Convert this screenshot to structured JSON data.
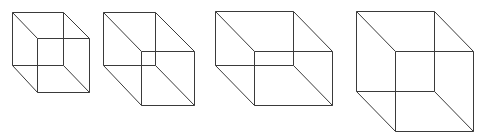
{
  "diagram": {
    "title": "",
    "stroke_color": "#3a3a3a",
    "background": "#ffffff",
    "cubes": [
      {
        "name": "cube-1",
        "back": {
          "tl": [
            12,
            12
          ],
          "tr": [
            63,
            12
          ],
          "bl": [
            12,
            65
          ],
          "br": [
            63,
            65
          ]
        },
        "front": {
          "tl": [
            37,
            38
          ],
          "tr": [
            89,
            38
          ],
          "bl": [
            37,
            92
          ],
          "br": [
            89,
            92
          ]
        }
      },
      {
        "name": "cube-2",
        "back": {
          "tl": [
            103,
            12
          ],
          "tr": [
            155,
            12
          ],
          "bl": [
            103,
            65
          ],
          "br": [
            155,
            65
          ]
        },
        "front": {
          "tl": [
            141,
            51
          ],
          "tr": [
            194,
            51
          ],
          "bl": [
            141,
            105
          ],
          "br": [
            194,
            105
          ]
        }
      },
      {
        "name": "cube-3",
        "back": {
          "tl": [
            215,
            11
          ],
          "tr": [
            293,
            11
          ],
          "bl": [
            215,
            65
          ],
          "br": [
            293,
            65
          ]
        },
        "front": {
          "tl": [
            254,
            51
          ],
          "tr": [
            332,
            51
          ],
          "bl": [
            254,
            105
          ],
          "br": [
            332,
            105
          ]
        }
      },
      {
        "name": "cube-4",
        "back": {
          "tl": [
            356,
            11
          ],
          "tr": [
            434,
            11
          ],
          "bl": [
            356,
            91
          ],
          "br": [
            434,
            91
          ]
        },
        "front": {
          "tl": [
            395,
            51
          ],
          "tr": [
            473,
            51
          ],
          "bl": [
            395,
            131
          ],
          "br": [
            473,
            131
          ]
        }
      }
    ]
  }
}
